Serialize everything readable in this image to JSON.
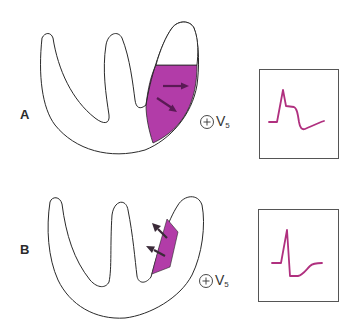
{
  "figure": {
    "colors": {
      "outline": "#2a2a2a",
      "infarct": "#b23ca8",
      "arrow": "#5a1a55",
      "ecg_trace": "#b0307f",
      "box": "#555555"
    },
    "panels": [
      {
        "label": "A",
        "lead_symbol": "⊕",
        "lead_name": "V",
        "lead_sub": "5",
        "infarct": "transmural region of left ventricular wall",
        "arrow_direction": "toward electrode",
        "ecg": "ST elevation"
      },
      {
        "label": "B",
        "lead_symbol": "⊕",
        "lead_name": "V",
        "lead_sub": "5",
        "infarct": "subendocardial/septal region",
        "arrow_direction": "away from electrode",
        "ecg": "ST depression"
      }
    ]
  }
}
